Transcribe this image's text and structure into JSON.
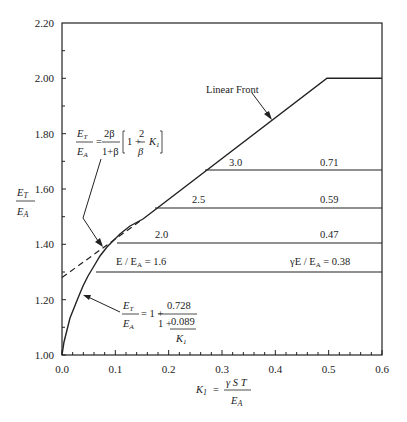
{
  "chart_data": {
    "type": "line",
    "title": "",
    "xlabel": "K1 = γST / EA",
    "ylabel": "ET / EA",
    "xlim": [
      0.0,
      0.6
    ],
    "ylim": [
      1.0,
      2.2
    ],
    "x_ticks": [
      "0.0",
      "0.1",
      "0.2",
      "0.3",
      "0.4",
      "0.5",
      "0.6"
    ],
    "y_ticks": [
      "1.00",
      "1.20",
      "1.40",
      "1.60",
      "1.80",
      "2.00",
      "2.20"
    ],
    "grid": false,
    "legend": null,
    "series": [
      {
        "name": "ET/EA = 1 + 0.728 / (1 + 0.089/K1)",
        "style": "solid",
        "x": [
          0.0,
          0.01,
          0.02,
          0.04,
          0.06,
          0.08,
          0.1,
          0.12,
          0.15
        ],
        "y": [
          1.0,
          1.074,
          1.133,
          1.225,
          1.292,
          1.343,
          1.385,
          1.418,
          1.457
        ]
      },
      {
        "name": "ET/EA = 2β/(1+β) [1 + (2/β) K1]",
        "style": "dashed",
        "x": [
          0.0,
          0.15
        ],
        "y": [
          1.28,
          1.495
        ]
      },
      {
        "name": "Linear Front",
        "style": "solid",
        "x": [
          0.15,
          0.5,
          0.6
        ],
        "y": [
          1.495,
          2.0,
          2.0
        ]
      },
      {
        "name": "E/EA = 1.6, γE/EA = 0.38",
        "style": "solid",
        "x": [
          0.065,
          0.6
        ],
        "y": [
          1.3,
          1.3
        ]
      },
      {
        "name": "E/EA = 2.0, γE/EA = 0.47",
        "style": "solid",
        "x": [
          0.103,
          0.6
        ],
        "y": [
          1.4,
          1.4
        ]
      },
      {
        "name": "E/EA = 2.5, γE/EA = 0.59",
        "style": "solid",
        "x": [
          0.173,
          0.6
        ],
        "y": [
          1.53,
          1.53
        ]
      },
      {
        "name": "E/EA = 3.0, γE/EA = 0.71",
        "style": "solid",
        "x": [
          0.268,
          0.6
        ],
        "y": [
          1.665,
          1.665
        ]
      }
    ],
    "annotations": [
      "Linear Front",
      "3.0",
      "0.71",
      "2.5",
      "0.59",
      "2.0",
      "0.47",
      "E / EA = 1.6",
      "γE / EA = 0.38",
      "ET/EA = 2β/(1+β) [1 + 2/β K1]",
      "ET/EA = 1 + 0.728 / (1 + 0.089/K1)"
    ]
  },
  "labels": {
    "linear_front": "Linear Front",
    "e30": "3.0",
    "g71": "0.71",
    "e25": "2.5",
    "g59": "0.59",
    "e20": "2.0",
    "g47": "0.47",
    "e16": "E / E",
    "e16_sub": "A",
    "e16_val": " = 1.6",
    "g38": "γE / E",
    "g38_sub": "A",
    "g38_val": " = 0.38",
    "ylabel_num": "E",
    "ylabel_num_sub": "T",
    "ylabel_den": "E",
    "ylabel_den_sub": "A",
    "xlabel_k": "K",
    "xlabel_k_sub": "1",
    "xlabel_eq": " = ",
    "xlabel_num": "γ S T",
    "xlabel_den": "E",
    "xlabel_den_sub": "A",
    "eq1_two_beta": "2β",
    "eq1_one_plus_beta": "1+β",
    "eq1_bracket": "1 + ",
    "eq1_two": "2",
    "eq1_beta": "β",
    "eq1_k": "K",
    "eq1_k_sub": "1",
    "eq2_one_plus": "= 1 + ",
    "eq2_num": "0.728",
    "eq2_den_one": "1 + ",
    "eq2_den_num": "0.089",
    "eq2_den_k": "K",
    "eq2_den_k_sub": "1",
    "eq_E": "E",
    "eq_T": "T",
    "eq_A": "A",
    "eq_eq": "="
  }
}
